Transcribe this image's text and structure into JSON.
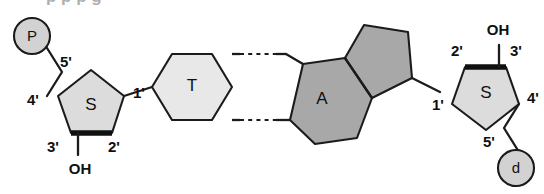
{
  "figure": {
    "background_color": "#ffffff",
    "cropped_caption_above": "p       p      p      g"
  },
  "palette": {
    "outline": "#1b1b1b",
    "sugar_fill": "#dcdcdc",
    "thymine_fill": "#e8e8e8",
    "adenine_fill": "#a8a8a8",
    "circle_fill": "#d2d2d2",
    "text": "#101010"
  },
  "left_strand": {
    "phosphate": {
      "label": "P",
      "name": "phosphate-group"
    },
    "sugar": {
      "label": "S",
      "name": "deoxyribose-sugar",
      "carbons": {
        "c5": "5'",
        "c4": "4'",
        "c3": "3'",
        "c2": "2'",
        "c1": "1'"
      },
      "hydroxyl": "OH"
    }
  },
  "right_strand": {
    "phosphate": {
      "label": "d",
      "name": "phosphate-group"
    },
    "sugar": {
      "label": "S",
      "name": "deoxyribose-sugar",
      "carbons": {
        "c5": "5'",
        "c4": "4'",
        "c3": "3'",
        "c2": "2'",
        "c1": "1'"
      },
      "hydroxyl": "OH"
    }
  },
  "bases": {
    "thymine": {
      "label": "T",
      "name": "thymine-base",
      "ring_type": "pyrimidine-hexagon",
      "fill": "#e8e8e8"
    },
    "adenine": {
      "label": "A",
      "name": "adenine-base",
      "ring_type": "purine-fused-hexagon-pentagon",
      "fill": "#a8a8a8"
    },
    "hydrogen_bonds": {
      "count": 2,
      "style": "dashed",
      "name": "hydrogen-bond"
    }
  }
}
